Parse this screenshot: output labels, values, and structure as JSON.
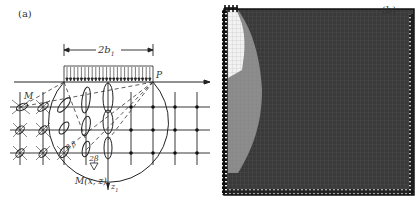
{
  "figure": {
    "panel_a": {
      "label": "(a)",
      "dimension_label": "2b",
      "dimension_subscript": "1",
      "point_P": "P",
      "point_M": "M",
      "point_Mxz": "M(x, z)",
      "axis_z_label": "z",
      "axis_z_subscript": "1",
      "angle_label_1": "β β",
      "angle_label_2": "2β",
      "description": "Strip load of width 2b1 on soil surface with stress ellipses, grid, and arc through load edges"
    },
    "panel_b": {
      "label": "(b)",
      "description": "Finite element mesh contour: white zone near load, light gray arc zone, dark gray background",
      "colors": {
        "white_zone": "#f2f2f2",
        "gray_zone": "#8c8c8c",
        "dark_zone": "#3a3a3a",
        "frame": "#1a1a1a"
      }
    }
  }
}
